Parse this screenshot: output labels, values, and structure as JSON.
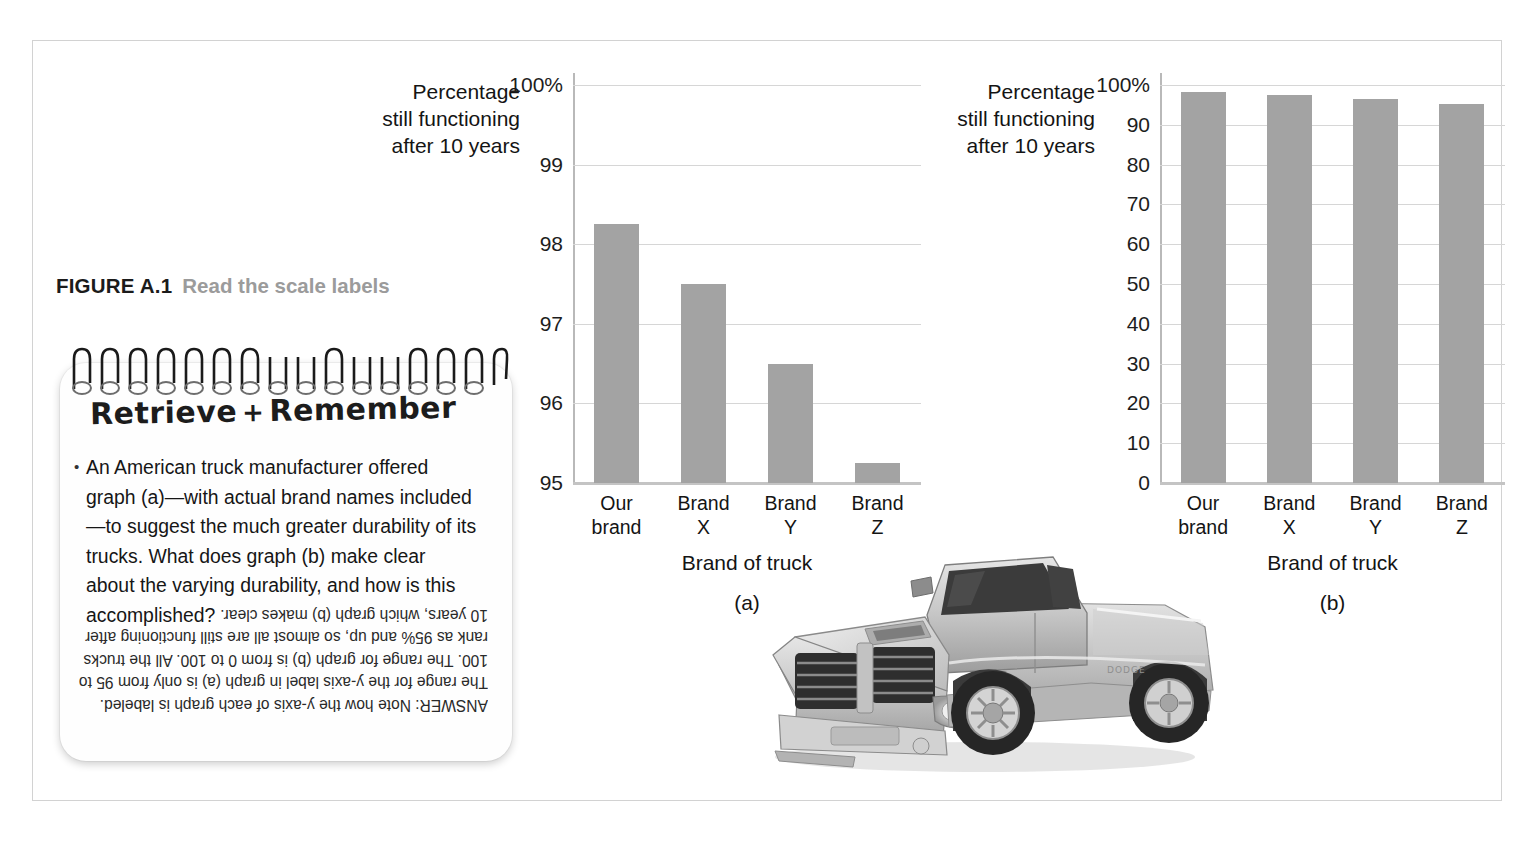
{
  "figure": {
    "label": "FIGURE A.1",
    "title": "Read the scale labels"
  },
  "notepad": {
    "heading_left": "Retrieve",
    "heading_plus": "+",
    "heading_right": "Remember",
    "bullet": "An American truck manufacturer offered graph (a)—with actual brand names included—to suggest the much greater durability of its trucks. What does graph (b) make clear about the varying durability, and how is this accomplished?",
    "answer": "ANSWER: Note how the y-axis of each graph is labeled. The range for the y-axis label in graph (a) is only from 95 to 100. The range for graph (b) is from 0 to 100. All the trucks rank as 95% and up, so almost all are still functioning after 10 years, which graph (b) makes clear."
  },
  "photo": {
    "subject": "silver pickup truck",
    "credit": "Transtock/SuperStock"
  },
  "colors": {
    "bar": "#a3a3a3",
    "gridline": "#d6d6d6",
    "axis": "#b9b9b9",
    "caption_title": "#9b9b9b"
  },
  "chart_data": [
    {
      "type": "bar",
      "panel": "(a)",
      "title": "",
      "ylabel": "Percentage still functioning after 10 years",
      "ylabel_lines": [
        "Percentage",
        "still functioning",
        "after 10 years"
      ],
      "xlabel": "Brand of truck",
      "categories": [
        "Our brand",
        "Brand X",
        "Brand Y",
        "Brand Z"
      ],
      "category_lines": [
        [
          "Our",
          "brand"
        ],
        [
          "Brand",
          "X"
        ],
        [
          "Brand",
          "Y"
        ],
        [
          "Brand",
          "Z"
        ]
      ],
      "values": [
        98.25,
        97.5,
        96.5,
        95.25
      ],
      "ylim": [
        95,
        100
      ],
      "yticks": [
        95,
        96,
        97,
        98,
        99,
        100
      ],
      "ytick_labels": [
        "95",
        "96",
        "97",
        "98",
        "99",
        "100%"
      ],
      "grid": true,
      "legend": "none"
    },
    {
      "type": "bar",
      "panel": "(b)",
      "title": "",
      "ylabel": "Percentage still functioning after 10 years",
      "ylabel_lines": [
        "Percentage",
        "still functioning",
        "after 10 years"
      ],
      "xlabel": "Brand of truck",
      "categories": [
        "Our brand",
        "Brand X",
        "Brand Y",
        "Brand Z"
      ],
      "category_lines": [
        [
          "Our",
          "brand"
        ],
        [
          "Brand",
          "X"
        ],
        [
          "Brand",
          "Y"
        ],
        [
          "Brand",
          "Z"
        ]
      ],
      "values": [
        98.25,
        97.5,
        96.5,
        95.25
      ],
      "ylim": [
        0,
        100
      ],
      "yticks": [
        0,
        10,
        20,
        30,
        40,
        50,
        60,
        70,
        80,
        90,
        100
      ],
      "ytick_labels": [
        "0",
        "10",
        "20",
        "30",
        "40",
        "50",
        "60",
        "70",
        "80",
        "90",
        "100%"
      ],
      "grid": true,
      "legend": "none"
    }
  ]
}
